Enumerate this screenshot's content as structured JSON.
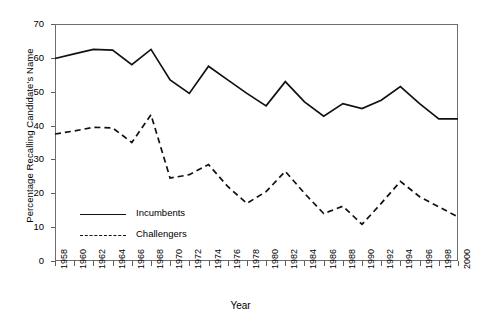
{
  "chart_data": {
    "type": "line",
    "title": "",
    "xlabel": "Year",
    "ylabel": "Percentage Recalling Candidate's Name",
    "x": [
      1958,
      1960,
      1962,
      1964,
      1966,
      1968,
      1970,
      1972,
      1974,
      1976,
      1978,
      1980,
      1982,
      1984,
      1986,
      1988,
      1990,
      1992,
      1994,
      1996,
      1998,
      2000
    ],
    "xlim": [
      1958,
      2000
    ],
    "ylim": [
      0,
      70
    ],
    "yticks": [
      0,
      10,
      20,
      30,
      40,
      50,
      60,
      70
    ],
    "xticks": [
      "1958",
      "1960",
      "1962",
      "1964",
      "1966",
      "1968",
      "1970",
      "1972",
      "1974",
      "1976",
      "1978",
      "1980",
      "1982",
      "1984",
      "1986",
      "1988",
      "1990",
      "1992",
      "1994",
      "1996",
      "1998",
      "2000"
    ],
    "grid": false,
    "legend_position": "inside-lower-left",
    "series": [
      {
        "name": "Incumbents",
        "style": "solid",
        "color": "#111111",
        "values": [
          59.8,
          61.2,
          62.5,
          62.3,
          58.0,
          62.5,
          53.5,
          49.5,
          57.5,
          53.5,
          49.5,
          45.8,
          53.0,
          47.0,
          42.8,
          46.5,
          45.0,
          47.5,
          51.5,
          46.5,
          42.0,
          42.0
        ]
      },
      {
        "name": "Challengers",
        "style": "dashed",
        "color": "#111111",
        "values": [
          37.5,
          38.4,
          39.5,
          39.3,
          35.0,
          43.2,
          24.5,
          25.5,
          28.5,
          22.0,
          17.0,
          20.5,
          26.5,
          20.0,
          14.0,
          16.2,
          10.8,
          17.0,
          23.5,
          19.0,
          16.0,
          13.0
        ]
      }
    ]
  },
  "axes": {
    "y_title": "Percentage Recalling Candidate's Name",
    "x_title": "Year"
  },
  "legend": {
    "entries": [
      {
        "label": "Incumbents"
      },
      {
        "label": "Challengers"
      }
    ]
  }
}
